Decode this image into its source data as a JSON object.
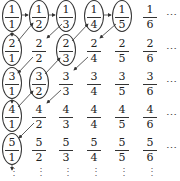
{
  "columns_x": [
    12,
    39,
    66,
    94,
    122,
    150
  ],
  "rows_y": [
    4,
    38,
    71,
    104,
    137
  ],
  "grid": [
    [
      {
        "n": "1",
        "d": "1",
        "c": true
      },
      {
        "n": "1",
        "d": "2",
        "c": true
      },
      {
        "n": "1",
        "d": "3",
        "c": true
      },
      {
        "n": "1",
        "d": "4",
        "c": true
      },
      {
        "n": "1",
        "d": "5",
        "c": true
      },
      {
        "n": "1",
        "d": "6",
        "c": false
      }
    ],
    [
      {
        "n": "2",
        "d": "1",
        "c": true
      },
      {
        "n": "2",
        "d": "2",
        "c": false
      },
      {
        "n": "2",
        "d": "3",
        "c": true
      },
      {
        "n": "2",
        "d": "4",
        "c": false
      },
      {
        "n": "2",
        "d": "5",
        "c": false
      },
      {
        "n": "2",
        "d": "6",
        "c": false
      }
    ],
    [
      {
        "n": "3",
        "d": "1",
        "c": true
      },
      {
        "n": "3",
        "d": "2",
        "c": true
      },
      {
        "n": "3",
        "d": "3",
        "c": false
      },
      {
        "n": "3",
        "d": "4",
        "c": false
      },
      {
        "n": "3",
        "d": "5",
        "c": false
      },
      {
        "n": "3",
        "d": "6",
        "c": false
      }
    ],
    [
      {
        "n": "4",
        "d": "1",
        "c": true
      },
      {
        "n": "4",
        "d": "2",
        "c": false
      },
      {
        "n": "4",
        "d": "3",
        "c": false
      },
      {
        "n": "4",
        "d": "4",
        "c": false
      },
      {
        "n": "4",
        "d": "5",
        "c": false
      },
      {
        "n": "4",
        "d": "6",
        "c": false
      }
    ],
    [
      {
        "n": "5",
        "d": "1",
        "c": true
      },
      {
        "n": "5",
        "d": "2",
        "c": false
      },
      {
        "n": "5",
        "d": "3",
        "c": false
      },
      {
        "n": "5",
        "d": "4",
        "c": false
      },
      {
        "n": "5",
        "d": "5",
        "c": false
      },
      {
        "n": "5",
        "d": "6",
        "c": false
      }
    ]
  ],
  "row_ellipsis": "⋯",
  "col_ellipsis": "⋮",
  "arrow_color": "#333333",
  "arrows": [
    {
      "from": "1/1",
      "to": "1/2"
    },
    {
      "from": "1/2",
      "to": "1/3"
    },
    {
      "from": "1/4",
      "to": "1/5"
    },
    {
      "from": "1/1",
      "to": "2/1"
    },
    {
      "from": "2/1",
      "to": "1/2"
    },
    {
      "from": "1/3",
      "to": "2/2"
    },
    {
      "from": "2/2",
      "to": "3/1"
    },
    {
      "from": "3/1",
      "to": "4/1"
    },
    {
      "from": "4/1",
      "to": "3/2"
    },
    {
      "from": "3/2",
      "to": "2/3"
    },
    {
      "from": "2/3",
      "to": "1/4"
    },
    {
      "from": "1/5",
      "to": "2/4"
    },
    {
      "from": "2/4",
      "to": "3/3"
    },
    {
      "from": "3/3",
      "to": "4/2"
    },
    {
      "from": "4/2",
      "to": "5/1"
    },
    {
      "from": "5/1",
      "to": "below"
    }
  ]
}
